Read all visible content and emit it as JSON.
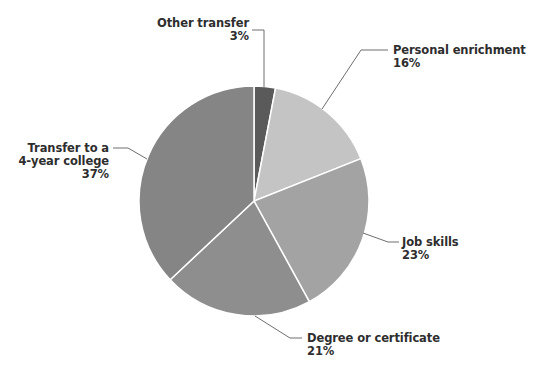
{
  "chart_data": {
    "type": "pie",
    "title": "",
    "start_angle_deg": 0,
    "direction": "clockwise",
    "center": [
      254,
      201
    ],
    "radius": 115,
    "slice_border_color": "#ffffff",
    "leader_color": "#6e6e6e",
    "slices": [
      {
        "name": "Other transfer",
        "value": 3,
        "value_label": "3%",
        "color": "#5a5a5a",
        "label_lines": [
          "Other transfer",
          "3%"
        ]
      },
      {
        "name": "Personal enrichment",
        "value": 16,
        "value_label": "16%",
        "color": "#c4c4c4",
        "label_lines": [
          "Personal enrichment",
          "16%"
        ]
      },
      {
        "name": "Job skills",
        "value": 23,
        "value_label": "23%",
        "color": "#a3a3a3",
        "label_lines": [
          "Job skills",
          "23%"
        ]
      },
      {
        "name": "Degree or certificate",
        "value": 21,
        "value_label": "21%",
        "color": "#8e8e8e",
        "label_lines": [
          "Degree or certificate",
          "21%"
        ]
      },
      {
        "name": "Transfer to a 4-year college",
        "value": 37,
        "value_label": "37%",
        "color": "#858585",
        "label_lines": [
          "Transfer to a",
          "4-year college",
          "37%"
        ]
      }
    ],
    "legend": "none (direct labels with leader lines)"
  },
  "labels": {
    "other_transfer": {
      "line1": "Other transfer",
      "line2": "3%"
    },
    "personal_enrichment": {
      "line1": "Personal enrichment",
      "line2": "16%"
    },
    "job_skills": {
      "line1": "Job skills",
      "line2": "23%"
    },
    "degree": {
      "line1": "Degree or certificate",
      "line2": "21%"
    },
    "transfer_4yr": {
      "line1": "Transfer to a",
      "line2": "4-year college",
      "line3": "37%"
    }
  }
}
